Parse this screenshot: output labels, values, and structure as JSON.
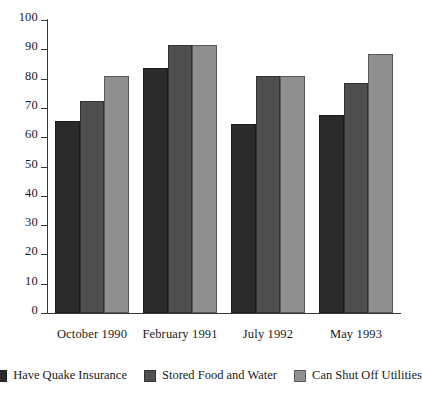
{
  "chart_data": {
    "type": "bar",
    "title": "",
    "subtitle": "",
    "xlabel": "",
    "ylabel": "",
    "ylim": [
      0,
      100
    ],
    "yticks": [
      0,
      10,
      20,
      30,
      40,
      50,
      60,
      70,
      80,
      90,
      100
    ],
    "grid": false,
    "legend_position": "bottom",
    "categories": [
      "October 1990",
      "February 1991",
      "July 1992",
      "May 1993"
    ],
    "series": [
      {
        "name": "Have Quake Insurance",
        "color": "#2b2b2b",
        "values": [
          65.5,
          83.5,
          64.5,
          67.5
        ]
      },
      {
        "name": "Stored Food and Water",
        "color": "#4f4f4f",
        "values": [
          72.5,
          91.5,
          81.0,
          78.5
        ]
      },
      {
        "name": "Can Shut Off Utilities",
        "color": "#8f8f8f",
        "values": [
          81.0,
          91.5,
          81.0,
          88.5
        ]
      }
    ]
  },
  "axis": {
    "tick_labels": [
      "0",
      "10",
      "20",
      "30",
      "40",
      "50",
      "60",
      "70",
      "80",
      "90",
      "100"
    ]
  }
}
